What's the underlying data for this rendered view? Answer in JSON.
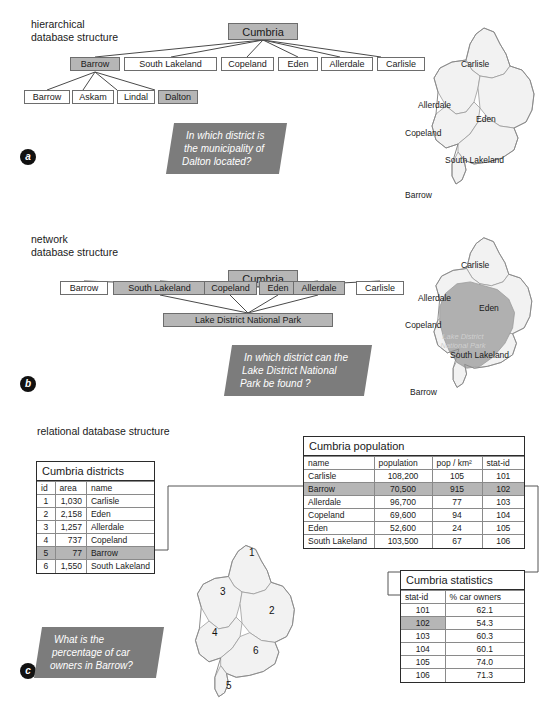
{
  "figure": {
    "panels": [
      {
        "letter": "a",
        "title": "hierarchical\ndatabase structure"
      },
      {
        "letter": "b",
        "title": "network\ndatabase structure"
      },
      {
        "letter": "c",
        "title": "relational database structure"
      }
    ]
  },
  "hierarchical": {
    "root": "Cumbria",
    "districts": [
      "Barrow",
      "South Lakeland",
      "Copeland",
      "Eden",
      "Allerdale",
      "Carlisle"
    ],
    "highlighted_district": "Barrow",
    "municipalities": [
      "Barrow",
      "Askam",
      "Lindal",
      "Dalton"
    ],
    "highlighted_municipality": "Dalton",
    "question": [
      "In which district is",
      "the municipality of",
      "Dalton located?"
    ]
  },
  "network": {
    "root": "Cumbria",
    "districts": [
      "Barrow",
      "South Lakeland",
      "Copeland",
      "Eden",
      "Allerdale",
      "Carlisle"
    ],
    "highlighted_districts": [
      "South Lakeland",
      "Copeland",
      "Eden",
      "Allerdale"
    ],
    "feature": "Lake District National Park",
    "question": [
      "In which district can the",
      "Lake District National",
      "Park be found ?"
    ]
  },
  "relational": {
    "question": [
      "What is the",
      "percentage of car",
      "owners in Barrow?"
    ],
    "districts_table": {
      "title": "Cumbria districts",
      "columns": [
        "id",
        "area",
        "name"
      ],
      "rows": [
        [
          "1",
          "1,030",
          "Carlisle"
        ],
        [
          "2",
          "2,158",
          "Eden"
        ],
        [
          "3",
          "1,257",
          "Allerdale"
        ],
        [
          "4",
          "737",
          "Copeland"
        ],
        [
          "5",
          "77",
          "Barrow"
        ],
        [
          "6",
          "1,550",
          "South Lakeland"
        ]
      ],
      "highlighted_row_index": 4
    },
    "population_table": {
      "title": "Cumbria population",
      "columns": [
        "name",
        "population",
        "pop / km²",
        "stat-id"
      ],
      "rows": [
        [
          "Carlisle",
          "108,200",
          "105",
          "101"
        ],
        [
          "Barrow",
          "70,500",
          "915",
          "102"
        ],
        [
          "Allerdale",
          "96,700",
          "77",
          "103"
        ],
        [
          "Copeland",
          "69,600",
          "94",
          "104"
        ],
        [
          "Eden",
          "52,600",
          "24",
          "105"
        ],
        [
          "South Lakeland",
          "103,500",
          "67",
          "106"
        ]
      ],
      "highlighted_row_index": 1
    },
    "statistics_table": {
      "title": "Cumbria statistics",
      "columns": [
        "stat-id",
        "% car owners"
      ],
      "rows": [
        [
          "101",
          "62.1"
        ],
        [
          "102",
          "54.3"
        ],
        [
          "103",
          "60.3"
        ],
        [
          "104",
          "60.1"
        ],
        [
          "105",
          "74.0"
        ],
        [
          "106",
          "71.3"
        ]
      ],
      "highlighted_row_index": 1
    }
  },
  "maps": {
    "map_a_labels": [
      "Carlisle",
      "Allerdale",
      "Eden",
      "Copeland",
      "South Lakeland",
      "Barrow"
    ],
    "map_b_labels": [
      "Carlisle",
      "Allerdale",
      "Eden",
      "Copeland",
      "South Lakeland",
      "Barrow"
    ],
    "map_b_park_label": [
      "Lake District",
      "National Park"
    ],
    "map_c_numbers": [
      "1",
      "2",
      "3",
      "4",
      "5",
      "6"
    ]
  },
  "colors": {
    "shade": "#b6b6b6",
    "callout": "#7c7c7c",
    "map_fill": "#f2f2f2",
    "map_park": "#b0b0b0"
  }
}
